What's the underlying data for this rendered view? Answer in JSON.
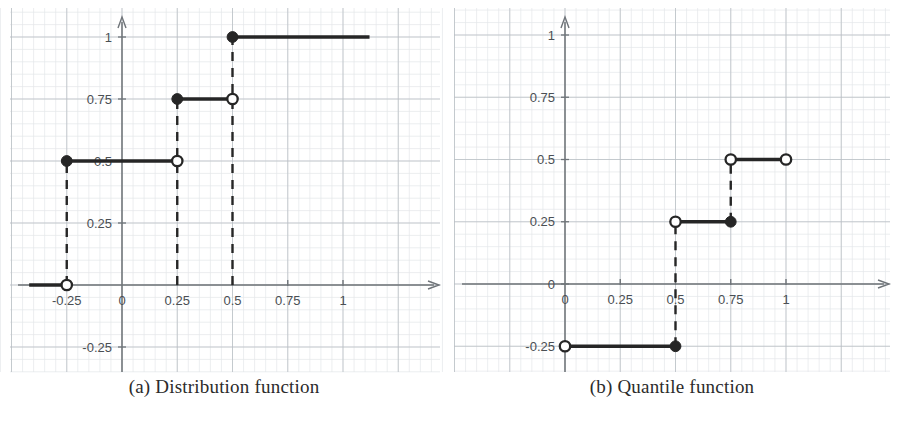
{
  "figure": {
    "panels": [
      {
        "id": "panel-a",
        "caption": "(a) Distribution function",
        "chart_index": 0
      },
      {
        "id": "panel-b",
        "caption": "(b) Quantile function",
        "chart_index": 1
      }
    ]
  },
  "style": {
    "ink": "#262626",
    "grid_major": "#b9bec4",
    "grid_minor": "#e4e7ea",
    "axis": "#6f7479",
    "tick_label": "#4a4f54",
    "paper": "#ffffff"
  },
  "chart_data": [
    {
      "type": "line",
      "subtype": "step",
      "title": "(a) Distribution function",
      "xlabel": "",
      "ylabel": "",
      "xlim": [
        -0.42,
        1.18
      ],
      "ylim": [
        -0.36,
        1.12
      ],
      "grid": true,
      "grid_step": 0.25,
      "legend": "none",
      "xticks": [
        -0.25,
        0,
        0.25,
        0.5,
        0.75,
        1
      ],
      "xticklabels": [
        "-0.25",
        "0",
        "0.25",
        "0.5",
        "0.75",
        "1"
      ],
      "yticks": [
        -0.25,
        0.25,
        0.5,
        0.75,
        1
      ],
      "yticklabels": [
        "-0.25",
        "0.25",
        "0.5",
        "0.75",
        "1"
      ],
      "segments": [
        {
          "y": 0,
          "x_start": -0.42,
          "x_end": -0.25,
          "left_marker": "none",
          "right_marker": "open"
        },
        {
          "y": 0.5,
          "x_start": -0.25,
          "x_end": 0.25,
          "left_marker": "filled",
          "right_marker": "open"
        },
        {
          "y": 0.75,
          "x_start": 0.25,
          "x_end": 0.5,
          "left_marker": "filled",
          "right_marker": "open"
        },
        {
          "y": 1,
          "x_start": 0.5,
          "x_end": 1.12,
          "left_marker": "filled",
          "right_marker": "none"
        }
      ],
      "risers": [
        {
          "x": -0.25,
          "y_start": 0,
          "y_end": 0.5
        },
        {
          "x": 0.25,
          "y_start": 0,
          "y_end": 0.75
        },
        {
          "x": 0.5,
          "y_start": 0,
          "y_end": 1
        }
      ]
    },
    {
      "type": "line",
      "subtype": "step",
      "title": "(b) Quantile function",
      "xlabel": "",
      "ylabel": "",
      "xlim": [
        -0.22,
        1.2
      ],
      "ylim": [
        -0.38,
        1.12
      ],
      "grid": true,
      "grid_step": 0.25,
      "legend": "none",
      "xticks": [
        0,
        0.25,
        0.5,
        0.75,
        1
      ],
      "xticklabels": [
        "0",
        "0.25",
        "0.5",
        "0.75",
        "1"
      ],
      "yticks": [
        -0.25,
        0,
        0.25,
        0.5,
        0.75,
        1
      ],
      "yticklabels": [
        "-0.25",
        "0",
        "0.25",
        "0.5",
        "0.75",
        "1"
      ],
      "segments": [
        {
          "y": -0.25,
          "x_start": 0,
          "x_end": 0.5,
          "left_marker": "open",
          "right_marker": "filled"
        },
        {
          "y": 0.25,
          "x_start": 0.5,
          "x_end": 0.75,
          "left_marker": "open",
          "right_marker": "filled"
        },
        {
          "y": 0.5,
          "x_start": 0.75,
          "x_end": 1,
          "left_marker": "open",
          "right_marker": "open"
        }
      ],
      "risers": [
        {
          "x": 0.5,
          "y_start": -0.25,
          "y_end": 0.25
        },
        {
          "x": 0.75,
          "y_start": 0.25,
          "y_end": 0.5
        }
      ]
    }
  ]
}
